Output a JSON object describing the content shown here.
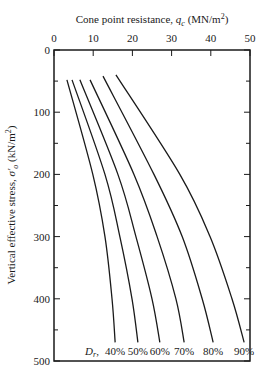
{
  "chart_data": {
    "type": "line",
    "title": "",
    "xlabel": "Cone point resistance, q_c (MN/m²)",
    "xlabel_parts": {
      "main": "Cone point resistance, ",
      "var": "q",
      "sub": "c",
      "unit": " (MN/m",
      "sup": "2",
      "close": ")"
    },
    "ylabel": "Vertical effective stress, σ′o (kN/m²)",
    "ylabel_parts": {
      "main": "Vertical effective stress, ",
      "var": "σ′",
      "sub": "o",
      "unit": " (kN/m",
      "sup": "2",
      "close": ")"
    },
    "xlim": [
      0,
      50
    ],
    "ylim": [
      0,
      500
    ],
    "x_axis_position": "top",
    "y_inverted": true,
    "xticks": [
      0,
      10,
      20,
      30,
      40,
      50
    ],
    "yticks": [
      0,
      100,
      200,
      300,
      400,
      500
    ],
    "grid": false,
    "legend_label": "D_r",
    "series": [
      {
        "name": "40%",
        "points": [
          [
            3.3,
            48
          ],
          [
            9.9,
            200
          ],
          [
            13.0,
            300
          ],
          [
            14.8,
            400
          ],
          [
            15.6,
            470
          ]
        ]
      },
      {
        "name": "50%",
        "points": [
          [
            4.6,
            48
          ],
          [
            13.0,
            200
          ],
          [
            16.8,
            300
          ],
          [
            19.9,
            400
          ],
          [
            21.4,
            470
          ]
        ]
      },
      {
        "name": "60%",
        "points": [
          [
            6.6,
            48
          ],
          [
            16.3,
            200
          ],
          [
            20.9,
            300
          ],
          [
            25.0,
            400
          ],
          [
            27.0,
            470
          ]
        ]
      },
      {
        "name": "70%",
        "points": [
          [
            9.2,
            48
          ],
          [
            20.4,
            200
          ],
          [
            26.3,
            300
          ],
          [
            31.1,
            400
          ],
          [
            33.2,
            470
          ]
        ]
      },
      {
        "name": "80%",
        "points": [
          [
            12.5,
            42
          ],
          [
            25.5,
            200
          ],
          [
            32.7,
            300
          ],
          [
            37.8,
            400
          ],
          [
            40.6,
            470
          ]
        ]
      },
      {
        "name": "90%",
        "points": [
          [
            15.8,
            40
          ],
          [
            32.1,
            200
          ],
          [
            39.8,
            300
          ],
          [
            45.4,
            400
          ],
          [
            48.5,
            470
          ]
        ]
      }
    ]
  },
  "labels": {
    "dr_symbol": "D",
    "dr_sub": "r",
    "dr_comma": ","
  }
}
